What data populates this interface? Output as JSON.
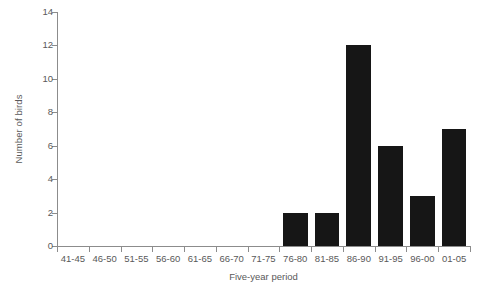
{
  "chart_data": {
    "type": "bar",
    "title": "",
    "xlabel": "Five-year period",
    "ylabel": "Number of birds",
    "categories": [
      "41-45",
      "46-50",
      "51-55",
      "56-60",
      "61-65",
      "66-70",
      "71-75",
      "76-80",
      "81-85",
      "86-90",
      "91-95",
      "96-00",
      "01-05"
    ],
    "values": [
      0,
      0,
      0,
      0,
      0,
      0,
      0,
      2,
      2,
      12,
      6,
      3,
      7
    ],
    "ylim": [
      0,
      14
    ],
    "yticks": [
      0,
      2,
      4,
      6,
      8,
      10,
      12,
      14
    ],
    "ytick_labels": [
      "0",
      "2",
      "4",
      "6",
      "8",
      "10",
      "12",
      "14"
    ],
    "grid": false,
    "legend": false,
    "colors": {
      "bar": "#161616",
      "axis": "#8c8c8c",
      "text": "#595959",
      "background": "#ffffff"
    }
  }
}
